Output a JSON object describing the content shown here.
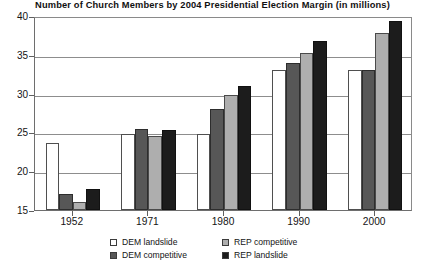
{
  "chart_data": {
    "type": "bar",
    "title": "Number of Church Members by 2004 Presidential Election Margin (in millions)",
    "xlabel": "",
    "ylabel": "",
    "ylim": [
      15,
      40
    ],
    "yticks": [
      15,
      20,
      25,
      30,
      35,
      40
    ],
    "grid": true,
    "legend_position": "bottom",
    "categories": [
      "1952",
      "1971",
      "1980",
      "1990",
      "2000"
    ],
    "series": [
      {
        "name": "DEM landslide",
        "color": "#ffffff",
        "values": [
          23.7,
          24.8,
          24.8,
          33.0,
          33.0
        ]
      },
      {
        "name": "DEM competitive",
        "color": "#575757",
        "values": [
          17.0,
          25.4,
          28.0,
          34.0,
          33.0
        ]
      },
      {
        "name": "REP competitive",
        "color": "#aeaeae",
        "values": [
          16.0,
          24.6,
          29.8,
          35.2,
          37.8
        ]
      },
      {
        "name": "REP landslide",
        "color": "#1c1c1c",
        "values": [
          17.7,
          25.3,
          31.0,
          36.8,
          39.3
        ]
      }
    ]
  }
}
